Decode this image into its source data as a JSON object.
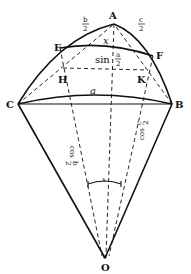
{
  "figure": {
    "type": "spherical triangle geometry diagram",
    "points": {
      "A": "A",
      "B": "B",
      "C": "C",
      "E": "E",
      "F": "F",
      "H": "H",
      "K": "K",
      "O": "O"
    },
    "labels": {
      "half_b": {
        "num": "b",
        "den": "2"
      },
      "half_c": {
        "num": "c",
        "den": "2"
      },
      "x_top": "x",
      "sin_half_a": {
        "prefix": "sin",
        "num": "a",
        "den": "2"
      },
      "side_a": "a",
      "cos_half_b": {
        "prefix": "cos",
        "num": "b",
        "den": "2"
      },
      "cos_half_c": {
        "prefix": "cos",
        "num": "c",
        "den": "2"
      },
      "x_angle": "x"
    }
  }
}
